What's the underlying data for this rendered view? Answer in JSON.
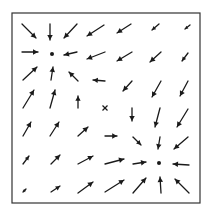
{
  "diagram": {
    "type": "vector-field",
    "frame": {
      "x": 12,
      "y": 13,
      "width": 188,
      "height": 190,
      "stroke": "#333333"
    },
    "colors": {
      "ink": "#1a1a1a",
      "background": "#ffffff"
    },
    "critical_points": [
      {
        "kind": "dot",
        "label": "attractor-upper-left",
        "x": 52,
        "y": 54
      },
      {
        "kind": "cross",
        "label": "saddle-center",
        "x": 105,
        "y": 108
      },
      {
        "kind": "dot",
        "label": "attractor-lower-right",
        "x": 159,
        "y": 163
      }
    ],
    "arrows": [
      {
        "x1": 22,
        "y1": 24,
        "x2": 36,
        "y2": 38
      },
      {
        "x1": 50,
        "y1": 24,
        "x2": 50,
        "y2": 40
      },
      {
        "x1": 77,
        "y1": 24,
        "x2": 64,
        "y2": 38
      },
      {
        "x1": 104,
        "y1": 25,
        "x2": 87,
        "y2": 36
      },
      {
        "x1": 131,
        "y1": 24,
        "x2": 117,
        "y2": 33
      },
      {
        "x1": 159,
        "y1": 24,
        "x2": 152,
        "y2": 30
      },
      {
        "x1": 190,
        "y1": 25,
        "x2": 185,
        "y2": 29
      },
      {
        "x1": 22,
        "y1": 52,
        "x2": 38,
        "y2": 52
      },
      {
        "x1": 77,
        "y1": 52,
        "x2": 64,
        "y2": 55
      },
      {
        "x1": 105,
        "y1": 52,
        "x2": 87,
        "y2": 59
      },
      {
        "x1": 132,
        "y1": 52,
        "x2": 117,
        "y2": 61
      },
      {
        "x1": 161,
        "y1": 52,
        "x2": 150,
        "y2": 62
      },
      {
        "x1": 188,
        "y1": 53,
        "x2": 182,
        "y2": 61
      },
      {
        "x1": 23,
        "y1": 80,
        "x2": 37,
        "y2": 67
      },
      {
        "x1": 51,
        "y1": 80,
        "x2": 53,
        "y2": 67
      },
      {
        "x1": 78,
        "y1": 81,
        "x2": 69,
        "y2": 72
      },
      {
        "x1": 105,
        "y1": 81,
        "x2": 93,
        "y2": 80
      },
      {
        "x1": 132,
        "y1": 81,
        "x2": 123,
        "y2": 91
      },
      {
        "x1": 161,
        "y1": 81,
        "x2": 152,
        "y2": 97
      },
      {
        "x1": 188,
        "y1": 81,
        "x2": 180,
        "y2": 96
      },
      {
        "x1": 23,
        "y1": 108,
        "x2": 34,
        "y2": 90
      },
      {
        "x1": 50,
        "y1": 108,
        "x2": 55,
        "y2": 90
      },
      {
        "x1": 78,
        "y1": 108,
        "x2": 78,
        "y2": 96
      },
      {
        "x1": 132,
        "y1": 108,
        "x2": 132,
        "y2": 121
      },
      {
        "x1": 160,
        "y1": 108,
        "x2": 155,
        "y2": 127
      },
      {
        "x1": 188,
        "y1": 109,
        "x2": 177,
        "y2": 127
      },
      {
        "x1": 23,
        "y1": 136,
        "x2": 31,
        "y2": 122
      },
      {
        "x1": 50,
        "y1": 136,
        "x2": 59,
        "y2": 122
      },
      {
        "x1": 78,
        "y1": 136,
        "x2": 88,
        "y2": 127
      },
      {
        "x1": 105,
        "y1": 136,
        "x2": 117,
        "y2": 136
      },
      {
        "x1": 133,
        "y1": 137,
        "x2": 141,
        "y2": 145
      },
      {
        "x1": 160,
        "y1": 137,
        "x2": 158,
        "y2": 149
      },
      {
        "x1": 188,
        "y1": 137,
        "x2": 174,
        "y2": 149
      },
      {
        "x1": 23,
        "y1": 164,
        "x2": 29,
        "y2": 156
      },
      {
        "x1": 51,
        "y1": 164,
        "x2": 60,
        "y2": 155
      },
      {
        "x1": 78,
        "y1": 164,
        "x2": 93,
        "y2": 156
      },
      {
        "x1": 105,
        "y1": 164,
        "x2": 124,
        "y2": 159
      },
      {
        "x1": 133,
        "y1": 164,
        "x2": 146,
        "y2": 162
      },
      {
        "x1": 189,
        "y1": 165,
        "x2": 173,
        "y2": 164
      },
      {
        "x1": 23,
        "y1": 192,
        "x2": 26,
        "y2": 189
      },
      {
        "x1": 51,
        "y1": 192,
        "x2": 60,
        "y2": 186
      },
      {
        "x1": 78,
        "y1": 193,
        "x2": 93,
        "y2": 182
      },
      {
        "x1": 105,
        "y1": 192,
        "x2": 124,
        "y2": 180
      },
      {
        "x1": 133,
        "y1": 193,
        "x2": 146,
        "y2": 178
      },
      {
        "x1": 161,
        "y1": 193,
        "x2": 160,
        "y2": 177
      },
      {
        "x1": 189,
        "y1": 193,
        "x2": 175,
        "y2": 179
      }
    ]
  }
}
